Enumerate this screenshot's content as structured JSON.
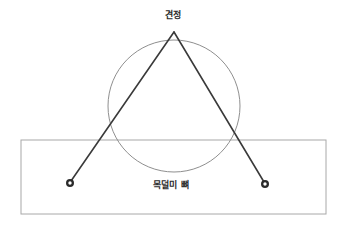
{
  "figure": {
    "background_color": "#ffffff",
    "labels": {
      "apex_point": "견정",
      "bone_structure": "목덜미 뼈"
    },
    "shapes": {
      "rectangle": {
        "name": "목덜미 뼈",
        "x": 21,
        "y": 140,
        "width": 305,
        "height": 74,
        "stroke": "#a8a8a8",
        "stroke_width": 1,
        "fill": "none"
      },
      "circle": {
        "name": "head-outline",
        "cx": 174,
        "cy": 106,
        "r": 66,
        "stroke": "#8f8f8f",
        "stroke_width": 1,
        "fill": "none"
      },
      "lines": [
        {
          "name": "left-measure-line",
          "x1": 174,
          "y1": 32,
          "x2": 71,
          "y2": 181,
          "stroke": "#3a3a3a",
          "stroke_width": 1.6
        },
        {
          "name": "right-measure-line",
          "x1": 174,
          "y1": 32,
          "x2": 264,
          "y2": 182,
          "stroke": "#3a3a3a",
          "stroke_width": 1.6
        }
      ],
      "markers": [
        {
          "name": "left-acupoint-marker",
          "cx": 70,
          "cy": 183,
          "r_outer": 4,
          "r_inner": 1.7,
          "stroke": "#2b2b2b",
          "stroke_width": 2.2,
          "fill": "#ffffff"
        },
        {
          "name": "right-acupoint-marker",
          "cx": 265,
          "cy": 184,
          "r_outer": 4,
          "r_inner": 1.7,
          "stroke": "#2b2b2b",
          "stroke_width": 2.2,
          "fill": "#ffffff"
        }
      ]
    }
  }
}
